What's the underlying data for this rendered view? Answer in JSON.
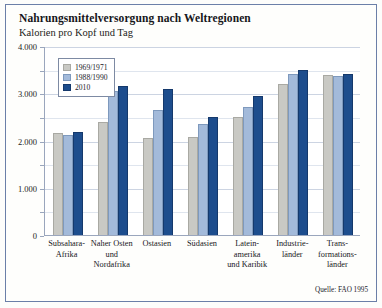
{
  "figure": {
    "title": "Nahrungsmittelversorgung nach Weltregionen",
    "subtitle": "Kalorien pro Kopf und Tag",
    "source": "Quelle: FAO 1995",
    "frame_color": "#6b7fa8"
  },
  "chart_data": {
    "type": "bar",
    "title": "Nahrungsmittelversorgung nach Weltregionen",
    "subtitle": "Kalorien pro Kopf und Tag",
    "xlabel": "",
    "ylabel": "Kalorien pro Kopf und Tag",
    "ylim": [
      0,
      4000
    ],
    "grid": true,
    "legend_position": "top-left-inside",
    "source": "Quelle: FAO 1995",
    "categories": [
      "Subsahara-\nAfrika",
      "Naher Osten\nund\nNordafrika",
      "Ostasien",
      "Südasien",
      "Latein-\namerika\nund Karibik",
      "Industrie-\nländer",
      "Trans-\nformations-\nländer"
    ],
    "series": [
      {
        "name": "1969/1971",
        "color": "#c9c9c4",
        "values": [
          2150,
          2400,
          2050,
          2070,
          2500,
          3200,
          3380
        ]
      },
      {
        "name": "1988/1990",
        "color": "#a3bada",
        "values": [
          2120,
          3050,
          2650,
          2350,
          2700,
          3400,
          3360
        ]
      },
      {
        "name": "2010",
        "color": "#1d4d8d",
        "values": [
          2180,
          3150,
          3100,
          2500,
          2950,
          3500,
          3400
        ]
      }
    ],
    "yticks_major": [
      {
        "value": 4000,
        "label": "4.000"
      },
      {
        "value": 3000,
        "label": "3.000"
      },
      {
        "value": 2000,
        "label": "2.000"
      },
      {
        "value": 1000,
        "label": "1.000"
      },
      {
        "value": 0,
        "label": "0"
      }
    ],
    "yticks_minor": [
      3500,
      2500,
      1500,
      500
    ]
  }
}
